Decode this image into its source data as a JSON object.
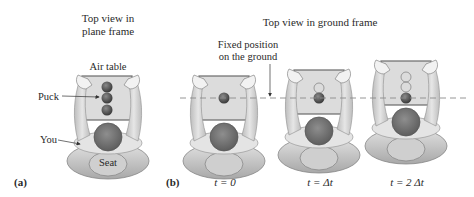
{
  "panel_a": {
    "label": "(a)",
    "title_line1": "Top view in",
    "title_line2": "plane frame",
    "air_table_label": "Air table",
    "puck_label": "Puck",
    "you_label": "You",
    "seat_label": "Seat"
  },
  "panel_b": {
    "label": "(b)",
    "title": "Top view in ground frame",
    "fixed_line1": "Fixed position",
    "fixed_line2": "on the ground",
    "time_labels": [
      "t = 0",
      "t = Δt",
      "t = 2 Δt"
    ]
  },
  "colors": {
    "puck": "#5a5a5a",
    "head": "#7a7a7a",
    "table": "#dcdcdc",
    "table_edge": "#6a6a6a",
    "body": "#d6d6d6",
    "seat": "#c8c8c8",
    "dashed_line": "#8a8a8a"
  }
}
